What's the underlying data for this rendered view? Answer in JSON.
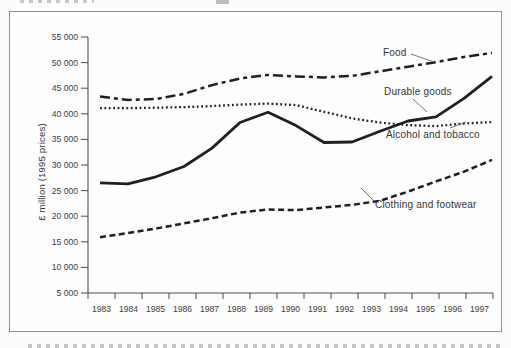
{
  "chart_data": {
    "type": "line",
    "title": "",
    "xlabel": "",
    "ylabel": "£ million (1995 prices)",
    "x_categories": [
      "1983",
      "1984",
      "1985",
      "1986",
      "1987",
      "1988",
      "1989",
      "1990",
      "1991",
      "1992",
      "1993",
      "1994",
      "1995",
      "1996",
      "1997"
    ],
    "ylim": [
      5000,
      55000
    ],
    "y_tick_interval": 5000,
    "y_tick_labels": [
      "5 000",
      "10 000",
      "15 000",
      "20 000",
      "25 000",
      "30 000",
      "35 000",
      "40 000",
      "45 000",
      "50 000",
      "55 000"
    ],
    "grid": false,
    "legend": "inline series labels with thin leader lines",
    "line_color": "#1f1f1f",
    "series": [
      {
        "name": "Food",
        "style": "dash-dot",
        "values": [
          43400,
          42700,
          42900,
          43900,
          45600,
          46900,
          47600,
          47300,
          47100,
          47400,
          48300,
          49200,
          50100,
          51100,
          51900
        ]
      },
      {
        "name": "Durable goods",
        "style": "solid",
        "values": [
          26500,
          26300,
          27700,
          29700,
          33300,
          38300,
          40300,
          37700,
          34400,
          34500,
          36600,
          38600,
          39400,
          43000,
          47300
        ]
      },
      {
        "name": "Alcohol and tobacco",
        "style": "dotted",
        "values": [
          41100,
          41100,
          41200,
          41300,
          41500,
          41800,
          42000,
          41700,
          40400,
          39100,
          38300,
          37800,
          37600,
          38100,
          38400
        ]
      },
      {
        "name": "Clothing and footwear",
        "style": "dashed",
        "values": [
          15900,
          16700,
          17600,
          18600,
          19600,
          20700,
          21300,
          21200,
          21700,
          22200,
          23000,
          24800,
          26800,
          28700,
          31000
        ]
      }
    ]
  }
}
